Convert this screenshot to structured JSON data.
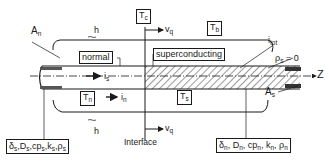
{
  "diagram": {
    "type": "superconducting-normal interface in a composite conductor (cross-section schematic)",
    "axis_label": "Z",
    "regions": {
      "normal": {
        "label": "normal",
        "temperature": "T",
        "temperature_sub": "n",
        "current": "i",
        "current_sub": "n"
      },
      "superconducting": {
        "label": "superconducting",
        "temperature": "T",
        "temperature_sub": "s"
      }
    },
    "top_temps": {
      "critical": {
        "main": "T",
        "sub": "c"
      },
      "bath": {
        "main": "T",
        "sub": "b"
      }
    },
    "velocity": {
      "main": "v",
      "sub": "q"
    },
    "interface_label": "Interface",
    "heat_transfer_top": "h",
    "heat_transfer_bottom": "h",
    "areas": {
      "normal_area": {
        "main": "A",
        "sub": "n"
      },
      "super_area": {
        "main": "A",
        "sub": "s"
      }
    },
    "currents": {
      "superconductor_current": {
        "main": "i",
        "sub": "s"
      },
      "total_current": {
        "main": "i",
        "sub": "tot"
      }
    },
    "resistivity_condition": {
      "main": "ρ",
      "sub": "s",
      "rest": " = 0"
    },
    "property_boxes": {
      "superconductor": [
        {
          "main": "δ",
          "sub": "s"
        },
        {
          "main": "D",
          "sub": "s"
        },
        {
          "main": "cp",
          "sub": "s"
        },
        {
          "main": "k",
          "sub": "s"
        },
        {
          "main": "ρ",
          "sub": "s"
        }
      ],
      "normal_metal": [
        {
          "main": "δ",
          "sub": "n"
        },
        {
          "main": "D",
          "sub": "n"
        },
        {
          "main": "cp",
          "sub": "n"
        },
        {
          "main": "k",
          "sub": "n"
        },
        {
          "main": "ρ",
          "sub": "n"
        }
      ]
    },
    "colors": {
      "ink": "#1a1a1a",
      "background": "#ffffff"
    }
  }
}
